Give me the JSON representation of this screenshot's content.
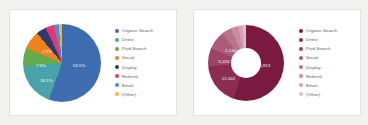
{
  "page": {
    "background": "#f2f2f0",
    "card_background": "#ffffff",
    "card_border": "#e2e2e0"
  },
  "chart_data": [
    {
      "id": "traffic-channel-pie",
      "type": "pie",
      "title": "",
      "subtitle": "",
      "xlabel": "",
      "ylabel": "",
      "legend_position": "right",
      "grid": false,
      "value_unit": "percent",
      "categories": [
        "Organic Search",
        "Direct",
        "Paid Search",
        "Social",
        "Display",
        "Referral",
        "Email",
        "(Other)"
      ],
      "values": [
        55.5,
        18.1,
        7.6,
        7.7,
        4.2,
        3.5,
        2.0,
        1.4
      ],
      "colors": [
        "#3d6cb0",
        "#4aa3ab",
        "#63ab4b",
        "#f0821e",
        "#2a3b74",
        "#e8356d",
        "#4b8fd6",
        "#f6b23c"
      ],
      "data_labels": [
        {
          "text": "55.5%",
          "x_pct": 72,
          "y_pct": 53
        },
        {
          "text": "18.1%",
          "x_pct": 30,
          "y_pct": 73
        },
        {
          "text": "7.6%",
          "x_pct": 23,
          "y_pct": 53
        },
        {
          "text": "7.7%",
          "x_pct": 31,
          "y_pct": 35
        }
      ]
    },
    {
      "id": "traffic-channel-donut",
      "type": "pie",
      "variant": "donut",
      "title": "",
      "subtitle": "",
      "xlabel": "",
      "ylabel": "",
      "legend_position": "right",
      "grid": false,
      "value_unit": "sessions",
      "categories": [
        "Organic Search",
        "Direct",
        "Paid Search",
        "Social",
        "Display",
        "Referral",
        "Email",
        "(Other)"
      ],
      "values": [
        36913,
        12002,
        5220,
        5144,
        2780,
        2180,
        1320,
        930
      ],
      "colors": [
        "#7b1a40",
        "#8c2c50",
        "#9b4464",
        "#ab5c78",
        "#b9748c",
        "#c78ca0",
        "#d6a4b4",
        "#e4bcc8"
      ],
      "data_labels": [
        {
          "text": "36,913",
          "x_pct": 73,
          "y_pct": 53
        },
        {
          "text": "12,002",
          "x_pct": 27,
          "y_pct": 70
        },
        {
          "text": "5,220",
          "x_pct": 21,
          "y_pct": 48
        },
        {
          "text": "5,144",
          "x_pct": 30,
          "y_pct": 33
        }
      ]
    }
  ]
}
